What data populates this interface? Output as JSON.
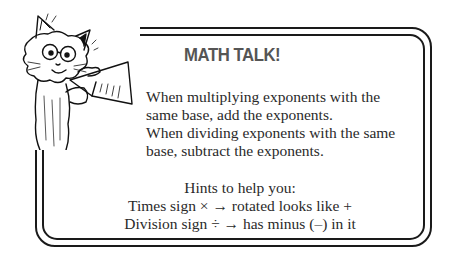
{
  "callout": {
    "title": "MATH TALK!",
    "paragraph_lines": [
      "When multiplying exponents with the",
      "same base, add the exponents.",
      "When dividing exponents with the same",
      "base, subtract the exponents."
    ],
    "hints_heading": "Hints to help you:",
    "hints": [
      "Times sign × → rotated looks like +",
      "Division sign ÷ → has minus (–) in it"
    ]
  },
  "illustration": {
    "icon": "cat-with-megaphone-icon"
  }
}
